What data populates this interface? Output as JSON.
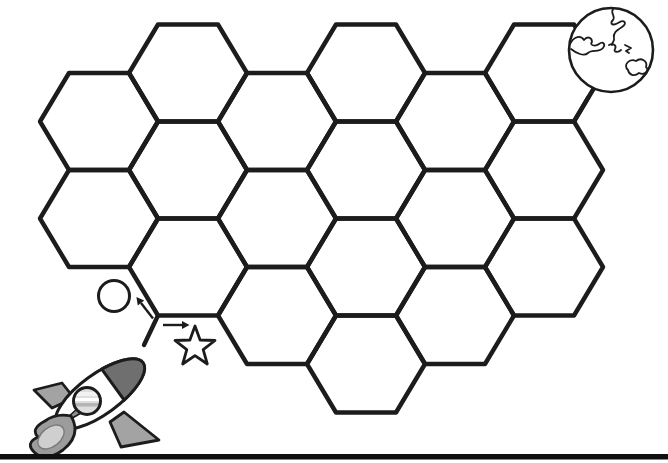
{
  "scene": {
    "kind": "hexagon-maze-worksheet",
    "background": "#ffffff",
    "line_color": "#1c1c1c"
  },
  "hex_grid": {
    "side": 60,
    "diag_dx": 29,
    "half_height": 48.5,
    "row_pitch": 97,
    "stroke_width": 4.4,
    "col_centers_x": [
      99,
      188,
      277,
      366,
      455,
      544
    ],
    "high_col_row0_cy": 73,
    "low_col_row0_cy": 121.5,
    "cells": [
      [
        0,
        0
      ],
      [
        0,
        1
      ],
      [
        1,
        0
      ],
      [
        1,
        1
      ],
      [
        1,
        2
      ],
      [
        2,
        0
      ],
      [
        2,
        1
      ],
      [
        2,
        2
      ],
      [
        3,
        0
      ],
      [
        3,
        1
      ],
      [
        3,
        2
      ],
      [
        3,
        3
      ],
      [
        4,
        0
      ],
      [
        4,
        1
      ],
      [
        4,
        2
      ],
      [
        5,
        0
      ],
      [
        5,
        1
      ],
      [
        5,
        2
      ]
    ]
  },
  "entry_stub": {
    "x1": 158,
    "y1": 315.5,
    "x2": 144,
    "y2": 345
  },
  "exit_stub": {
    "x1": 574,
    "y1": 121.5,
    "x2": 588.5,
    "y2": 97
  },
  "start_markers": {
    "circle": {
      "cx": 114,
      "cy": 296,
      "r": 15.5,
      "stroke_width": 3
    },
    "star": {
      "cx": 195,
      "cy": 347,
      "outer_r": 21,
      "inner_r": 8.6,
      "stroke_width": 2.8
    },
    "arrow_stroke": 2.4,
    "arrows": [
      {
        "name": "arrow-right-to-star",
        "x1": 163,
        "y1": 325,
        "x2": 182,
        "y2": 325
      },
      {
        "name": "arrow-upleft-to-circle",
        "x1": 153,
        "y1": 318.5,
        "x2": 141,
        "y2": 303
      }
    ]
  },
  "rocket": {
    "colors": {
      "outline": "#1c1c1c",
      "nose": "#6f6f6f",
      "fin": "#a3a3a3",
      "spike": "#8f8f8f",
      "window_fill": "#dedede",
      "flame_outer": "#9c9c9c",
      "flame_inner": "#cfcfcf",
      "flame_inner_edge": "#7a7a7a"
    },
    "body": {
      "cx": 100,
      "cy": 394,
      "rx": 53,
      "ry": 20,
      "angle": -36
    },
    "nose_local_path": "M 16,-19.1 A 53,20 0 0 1 16,19.1 Z",
    "fin_top": "62,383 34,390 52,408 74,398",
    "fin_bottom": "124,412 159,440 121,447 110,422",
    "spike": "57,427 88,399 93,406",
    "window": {
      "cx": 87,
      "cy": 401,
      "r": 13.5
    },
    "window_stripes": [
      {
        "x": 72,
        "y": 392,
        "w": 30,
        "h": 4,
        "color": "#f2f2f2"
      },
      {
        "x": 72,
        "y": 398,
        "w": 30,
        "h": 3,
        "color": "#ffffff"
      },
      {
        "x": 72,
        "y": 403,
        "w": 30,
        "h": 3.5,
        "color": "#b4b4b4"
      }
    ],
    "flame_outer_path": "M 71,416 Q 82,435 63,450 Q 45,463 34,452 Q 25,443 38,437 Q 30,429 45,421 Q 56,413 71,416 Z",
    "flame_inner": {
      "cx": 51,
      "cy": 437,
      "rx": 15,
      "ry": 9.5,
      "angle": -39
    }
  },
  "planet": {
    "cx": 611,
    "cy": 50,
    "r": 42,
    "stroke_width": 2.6,
    "continent_stroke": 1.8,
    "continents": [
      "M 613,9 C 610,14 616,16 613,20 C 609,24 613,26 618,23 C 624,19 628,23 622,27 C 616,31 613,33 614,38 C 615,41 612,42 612,45",
      "M 570,44 C 574,36 581,35 584,40 C 587,36 592,37 592,42 C 589,45 595,47 599,44 C 603,41 606,44 603,48 C 599,53 592,49 588,53 C 584,57 576,53 571,49",
      "M 609,45 C 613,43 617,45 615,49 C 613,52 618,53 621,50 M 625,45 l 6,3 l -5,3 l 3,2",
      "M 628,70 C 623,65 629,58 636,61 C 641,57 648,61 646,67 C 650,70 645,76 639,73 C 634,77 629,75 628,70 Z"
    ]
  },
  "ground_line": {
    "x": 0,
    "y": 454,
    "width": 668,
    "height": 5.5,
    "color": "#101010"
  }
}
